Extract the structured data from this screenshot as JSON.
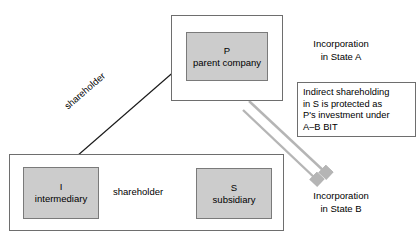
{
  "diagram": {
    "colors": {
      "box_fill": "#cccccc",
      "box_border": "#7a7a7a",
      "frame_border": "#6e6e6e",
      "arrow_black": "#1a1a1a",
      "arrow_gray": "#b3b3b3",
      "background": "#ffffff",
      "text": "#000000"
    },
    "entities": [
      {
        "id": "p",
        "code": "P",
        "desc": "parent company"
      },
      {
        "id": "i",
        "code": "I",
        "desc": "intermediary"
      },
      {
        "id": "s",
        "code": "S",
        "desc": "subsidiary"
      }
    ],
    "frames": [
      {
        "id": "state-a",
        "label": "Incorporation\nin State A"
      },
      {
        "id": "state-b",
        "label": "Incorporation\nin State B"
      }
    ],
    "annotations": {
      "incorporation_a": "Incorporation\nin State A",
      "incorporation_b": "Incorporation\nin State B",
      "bit_callout": "Indirect shareholding\nin S is protected as\nP's investment under\nA–B BIT"
    },
    "edges": [
      {
        "id": "p-to-i",
        "label": "shareholder",
        "from": "P",
        "to": "I",
        "style": "solid-black-arrow"
      },
      {
        "id": "i-to-s",
        "label": "shareholder",
        "from": "I",
        "to": "S",
        "style": "solid-black-arrow"
      },
      {
        "id": "p-to-stateb-1",
        "label": "",
        "from": "P",
        "to": "Incorporation in State B",
        "style": "gray-arrow"
      },
      {
        "id": "p-to-stateb-2",
        "label": "",
        "from": "P",
        "to": "Incorporation in State B",
        "style": "gray-arrow"
      }
    ],
    "edge_labels": {
      "diagonal_shareholder": "shareholder",
      "horizontal_shareholder": "shareholder"
    }
  }
}
